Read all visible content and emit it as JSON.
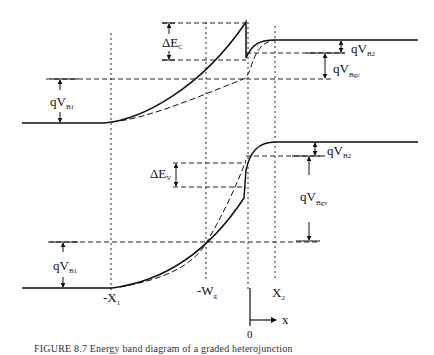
{
  "figure": {
    "type": "energy-band-diagram",
    "caption": "FIGURE 8.7  Energy band diagram of a graded heterojunction"
  },
  "labels": {
    "delta_ec": {
      "main": "ΔE",
      "sub": "C"
    },
    "delta_ev": {
      "main": "ΔE",
      "sub": "V"
    },
    "qvb1_top": {
      "main": "qV",
      "sub": "B1"
    },
    "qvb1_bottom": {
      "main": "qV",
      "sub": "B1"
    },
    "qvb2_top": {
      "main": "qV",
      "sub": "B2"
    },
    "qvb2_bottom": {
      "main": "qV",
      "sub": "B2"
    },
    "qvbgc": {
      "main": "qV",
      "sub": "Bgc"
    },
    "qvbgv": {
      "main": "qV",
      "sub": "Bgv"
    }
  },
  "axis": {
    "x_positions": [
      {
        "name": "-X",
        "sub": "1"
      },
      {
        "name": "-W",
        "sub": "g"
      },
      {
        "name": "X",
        "sub": "2"
      }
    ],
    "origin": "0",
    "axis_label": "x"
  },
  "bands": [
    {
      "name": "conduction-band",
      "style": "solid"
    },
    {
      "name": "conduction-band-abrupt-reference",
      "style": "dashed"
    },
    {
      "name": "valence-band",
      "style": "solid"
    },
    {
      "name": "valence-band-abrupt-reference",
      "style": "dashed"
    }
  ]
}
